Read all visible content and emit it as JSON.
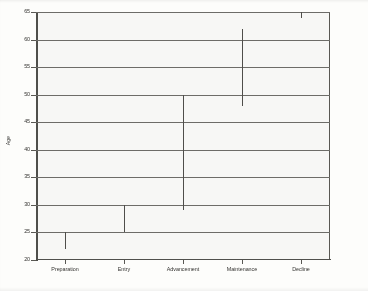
{
  "chart_data": {
    "type": "bar",
    "title": "",
    "subtitle": "",
    "xlabel": "",
    "ylabel": "Age",
    "categories": [
      "Preparation",
      "Entry",
      "Advancement",
      "Maintenance",
      "Decline"
    ],
    "series": [
      {
        "name": "Age range",
        "ranges": [
          {
            "category": "Preparation",
            "low": 22,
            "high": 25
          },
          {
            "category": "Entry",
            "low": 25,
            "high": 30
          },
          {
            "category": "Advancement",
            "low": 29,
            "high": 50
          },
          {
            "category": "Maintenance",
            "low": 48,
            "high": 62
          },
          {
            "category": "Decline",
            "low": 64,
            "high": 65
          }
        ]
      }
    ],
    "ylim": [
      20,
      65
    ],
    "yticks": [
      20,
      25,
      30,
      35,
      40,
      45,
      50,
      55,
      60,
      65
    ],
    "ytick_labels": [
      "20",
      "25",
      "30",
      "35",
      "40",
      "45",
      "50",
      "55",
      "60",
      "65"
    ],
    "grid": true,
    "grid_axis": "y",
    "legend": false,
    "legend_position": "none",
    "line_color": "#4a4945",
    "grid_color": "#6a6965",
    "axis_color": "#55544f",
    "background_color": "#fdfdfb"
  }
}
